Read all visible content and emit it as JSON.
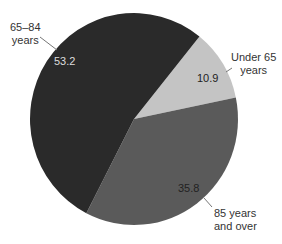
{
  "chart_data": {
    "type": "pie",
    "title": "",
    "slices": [
      {
        "label": "Under 65 years",
        "label_lines": [
          "Under 65",
          "years"
        ],
        "value": 10.9,
        "value_text": "10.9",
        "color": "#c4c4c4",
        "value_color": "#222222"
      },
      {
        "label": "85 years and over",
        "label_lines": [
          "85 years",
          "and over"
        ],
        "value": 35.8,
        "value_text": "35.8",
        "color": "#5a5a5a",
        "value_color": "#222222"
      },
      {
        "label": "65–84 years",
        "label_lines": [
          "65–84",
          "years"
        ],
        "value": 53.2,
        "value_text": "53.2",
        "color": "#2a2a2a",
        "value_color": "#dddddd"
      }
    ],
    "start_angle_deg": -51,
    "direction": "clockwise",
    "legend": "none (callout labels)"
  }
}
